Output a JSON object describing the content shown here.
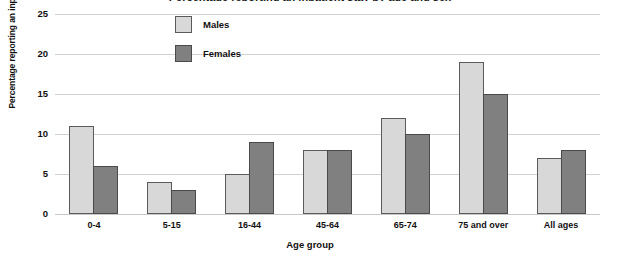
{
  "chart_data": {
    "type": "bar",
    "title": "Percentage reporting an inpatient stay by age and sex",
    "xlabel": "Age group",
    "ylabel": "Percentage reporting an inpatient stay",
    "categories": [
      "0-4",
      "5-15",
      "16-44",
      "45-64",
      "65-74",
      "75 and over",
      "All ages"
    ],
    "series": [
      {
        "name": "Males",
        "values": [
          11,
          4,
          5,
          8,
          12,
          19,
          7
        ],
        "color": "#d8d8d8"
      },
      {
        "name": "Females",
        "values": [
          6,
          3,
          9,
          8,
          10,
          15,
          8
        ],
        "color": "#808080"
      }
    ],
    "ylim": [
      0,
      25
    ],
    "yticks": [
      0,
      5,
      10,
      15,
      20,
      25
    ],
    "ytick_labels": [
      "0",
      "5",
      "10",
      "15",
      "20",
      "25"
    ],
    "grid": true,
    "legend_position": "top-center"
  },
  "legend": {
    "items": [
      {
        "label": "Males"
      },
      {
        "label": "Females"
      }
    ]
  }
}
